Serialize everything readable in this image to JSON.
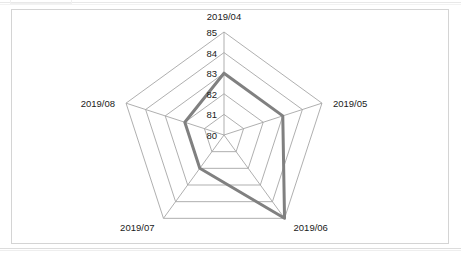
{
  "chart_data": {
    "type": "radar",
    "title": "",
    "subtitle": "",
    "xlabel": "",
    "ylabel": "",
    "categories": [
      "2019/04",
      "2019/05",
      "2019/06",
      "2019/07",
      "2019/08"
    ],
    "values": [
      83,
      83,
      85,
      82,
      82
    ],
    "series": [
      {
        "name": "",
        "values": [
          83,
          83,
          85,
          82,
          82
        ]
      }
    ],
    "rlim": [
      80,
      85
    ],
    "r_tick_labels": [
      "85",
      "84",
      "83",
      "82",
      "81",
      "80"
    ],
    "r_tick_values": [
      85,
      84,
      83,
      82,
      81,
      80
    ],
    "grid": true,
    "legend": "none",
    "colors": {
      "series_line": "#808080",
      "grid_line": "#a6a6a6",
      "spoke_line": "#a6a6a6",
      "frame_border": "#d4d4d4",
      "text": "#1a1a1a",
      "background": "#ffffff"
    },
    "style": {
      "series_line_width": 3,
      "grid_line_width": 0.9,
      "filled": false
    }
  },
  "frame": {
    "label": "chart-object-frame"
  }
}
